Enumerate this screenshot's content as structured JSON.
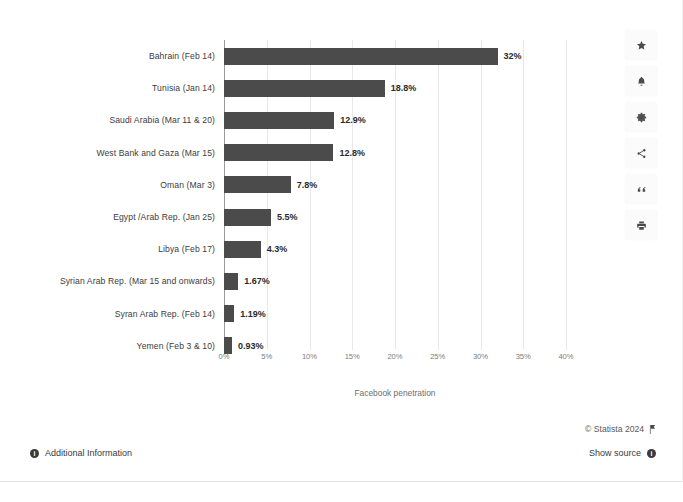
{
  "chart_data": {
    "type": "bar",
    "orientation": "horizontal",
    "title": "",
    "xlabel": "Facebook penetration",
    "ylabel": "",
    "xlim": [
      0,
      40
    ],
    "xtick_labels": [
      "0%",
      "5%",
      "10%",
      "15%",
      "20%",
      "25%",
      "30%",
      "35%",
      "40%"
    ],
    "xtick_values": [
      0,
      5,
      10,
      15,
      20,
      25,
      30,
      35,
      40
    ],
    "grid": true,
    "legend": "none",
    "bar_color": "#4b4b4b",
    "categories": [
      "Bahrain (Feb 14)",
      "Tunisia (Jan 14)",
      "Saudi Arabia (Mar 11 & 20)",
      "West Bank and Gaza (Mar 15)",
      "Oman (Mar 3)",
      "Egypt /Arab Rep. (Jan 25)",
      "Libya (Feb 17)",
      "Syrian Arab Rep. (Mar 15 and onwards)",
      "Syran Arab Rep. (Feb 14)",
      "Yemen (Feb 3 & 10)"
    ],
    "values": [
      32,
      18.8,
      12.9,
      12.8,
      7.8,
      5.5,
      4.3,
      1.67,
      1.19,
      0.93
    ],
    "value_labels": [
      "32%",
      "18.8%",
      "12.9%",
      "12.8%",
      "7.8%",
      "5.5%",
      "4.3%",
      "1.67%",
      "1.19%",
      "0.93%"
    ]
  },
  "tool_rail": [
    {
      "name": "favorite-star-icon",
      "label": "Favorite"
    },
    {
      "name": "notification-bell-icon",
      "label": "Notifications"
    },
    {
      "name": "settings-gear-icon",
      "label": "Settings"
    },
    {
      "name": "share-icon",
      "label": "Share"
    },
    {
      "name": "cite-quote-icon",
      "label": "Cite"
    },
    {
      "name": "print-icon",
      "label": "Print"
    }
  ],
  "footer": {
    "copyright": "© Statista 2024",
    "additional_information": "Additional Information",
    "show_source": "Show source",
    "info_glyph": "i"
  }
}
